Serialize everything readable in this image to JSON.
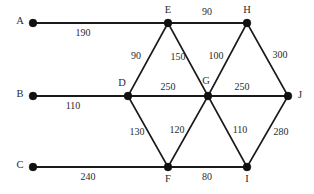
{
  "diagram": {
    "type": "weighted-undirected-graph",
    "width": 314,
    "height": 194,
    "background_color": "#ffffff",
    "stroke_color": "#1a1a1a",
    "text_color": "#2b2b2b",
    "nodes": [
      {
        "id": "A",
        "label": "A",
        "x": 33,
        "y": 23,
        "label_x": 20,
        "label_y": 22,
        "anchor": "middle"
      },
      {
        "id": "E",
        "label": "E",
        "x": 168,
        "y": 23,
        "label_x": 168,
        "label_y": 11,
        "anchor": "middle"
      },
      {
        "id": "H",
        "label": "H",
        "x": 247,
        "y": 23,
        "label_x": 247,
        "label_y": 11,
        "anchor": "middle"
      },
      {
        "id": "B",
        "label": "B",
        "x": 33,
        "y": 96,
        "label_x": 20,
        "label_y": 95,
        "anchor": "middle"
      },
      {
        "id": "D",
        "label": "D",
        "x": 128,
        "y": 96,
        "label_x": 122,
        "label_y": 84,
        "anchor": "middle"
      },
      {
        "id": "G",
        "label": "G",
        "x": 208,
        "y": 96,
        "label_x": 206,
        "label_y": 82,
        "anchor": "middle"
      },
      {
        "id": "J",
        "label": "J",
        "x": 288,
        "y": 96,
        "label_x": 300,
        "label_y": 96,
        "anchor": "middle"
      },
      {
        "id": "C",
        "label": "C",
        "x": 33,
        "y": 167,
        "label_x": 20,
        "label_y": 166,
        "anchor": "middle"
      },
      {
        "id": "F",
        "label": "F",
        "x": 168,
        "y": 167,
        "label_x": 168,
        "label_y": 180,
        "anchor": "middle"
      },
      {
        "id": "I",
        "label": "I",
        "x": 247,
        "y": 167,
        "label_x": 247,
        "label_y": 180,
        "anchor": "middle"
      }
    ],
    "edges": [
      {
        "from": "A",
        "to": "E",
        "weight": "190",
        "weight_x": 83,
        "weight_y": 34,
        "thick": true
      },
      {
        "from": "E",
        "to": "H",
        "weight": "90",
        "weight_x": 207,
        "weight_y": 13,
        "thick": true
      },
      {
        "from": "D",
        "to": "E",
        "weight": "90",
        "weight_x": 136,
        "weight_y": 57,
        "thick": false
      },
      {
        "from": "E",
        "to": "G",
        "weight": "150",
        "weight_x": 178,
        "weight_y": 58,
        "thick": false
      },
      {
        "from": "G",
        "to": "H",
        "weight": "100",
        "weight_x": 216,
        "weight_y": 57,
        "thick": false
      },
      {
        "from": "H",
        "to": "J",
        "weight": "300",
        "weight_x": 280,
        "weight_y": 56,
        "thick": false
      },
      {
        "from": "B",
        "to": "D",
        "weight": "110",
        "weight_x": 73,
        "weight_y": 107,
        "thick": true
      },
      {
        "from": "D",
        "to": "G",
        "weight": "250",
        "weight_x": 168,
        "weight_y": 88,
        "thick": true
      },
      {
        "from": "G",
        "to": "J",
        "weight": "250",
        "weight_x": 242,
        "weight_y": 88,
        "thick": true
      },
      {
        "from": "D",
        "to": "F",
        "weight": "130",
        "weight_x": 137,
        "weight_y": 133,
        "thick": false
      },
      {
        "from": "F",
        "to": "G",
        "weight": "120",
        "weight_x": 177,
        "weight_y": 131,
        "thick": false
      },
      {
        "from": "G",
        "to": "I",
        "weight": "110",
        "weight_x": 240,
        "weight_y": 131,
        "thick": false
      },
      {
        "from": "I",
        "to": "J",
        "weight": "280",
        "weight_x": 281,
        "weight_y": 133,
        "thick": false
      },
      {
        "from": "C",
        "to": "F",
        "weight": "240",
        "weight_x": 88,
        "weight_y": 178,
        "thick": true
      },
      {
        "from": "F",
        "to": "I",
        "weight": "80",
        "weight_x": 207,
        "weight_y": 178,
        "thick": true
      }
    ]
  }
}
